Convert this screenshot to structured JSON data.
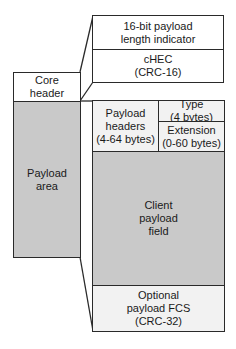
{
  "diagram": {
    "type": "frame-structure",
    "left_column": {
      "core_header": "Core\nheader",
      "payload_area": "Payload\narea"
    },
    "core_header_detail": {
      "length_indicator": "16-bit payload\nlength indicator",
      "chec": "cHEC\n(CRC-16)"
    },
    "payload_area_detail": {
      "payload_headers": "Payload\nheaders\n(4-64 bytes)",
      "type": "Type\n(4 bytes)",
      "extension": "Extension\n(0-60 bytes)",
      "client_payload": "Client\npayload\nfield",
      "fcs": "Optional\npayload FCS\n(CRC-32)"
    },
    "colors": {
      "line": "#2a2a2a",
      "light_fill": "#f2f2f2",
      "shaded_fill": "#cfcfcf",
      "background": "#ffffff"
    }
  }
}
